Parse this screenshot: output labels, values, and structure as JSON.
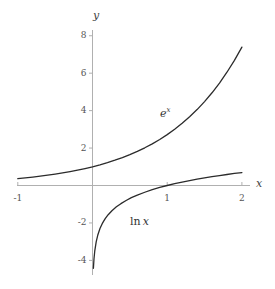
{
  "chart_data": {
    "type": "line",
    "title": "",
    "xlabel": "x",
    "ylabel": "y",
    "xlim": [
      -1.05,
      2.1
    ],
    "ylim": [
      -4.6,
      8.4
    ],
    "grid": false,
    "legend": "inline-annotations",
    "xticks": [
      -1,
      1,
      2
    ],
    "xtick_labels": [
      "-1",
      "1",
      "2"
    ],
    "yticks": [
      -4,
      -2,
      2,
      4,
      6,
      8
    ],
    "ytick_labels": [
      "-4",
      "-2",
      "2",
      "4",
      "6",
      "8"
    ],
    "annotations": [
      {
        "name": "exp-curve-label",
        "text": "e",
        "sup": "x",
        "x": 0.95,
        "y": 3.85
      },
      {
        "name": "ln-curve-label",
        "text": "ln",
        "arg": "x",
        "x": 0.52,
        "y": -1.95
      }
    ],
    "series": [
      {
        "name": "e^x",
        "label": "e^x",
        "color": "#2b2b2b",
        "x": [
          -1.0,
          -0.9,
          -0.8,
          -0.7,
          -0.6,
          -0.5,
          -0.4,
          -0.3,
          -0.2,
          -0.1,
          0.0,
          0.1,
          0.2,
          0.3,
          0.4,
          0.5,
          0.6,
          0.7,
          0.8,
          0.9,
          1.0,
          1.1,
          1.2,
          1.3,
          1.4,
          1.5,
          1.6,
          1.7,
          1.8,
          1.9,
          2.0
        ],
        "values": [
          0.368,
          0.407,
          0.449,
          0.497,
          0.549,
          0.607,
          0.67,
          0.741,
          0.819,
          0.905,
          1.0,
          1.105,
          1.221,
          1.35,
          1.492,
          1.649,
          1.822,
          2.014,
          2.226,
          2.46,
          2.718,
          3.004,
          3.32,
          3.669,
          4.055,
          4.482,
          4.953,
          5.474,
          6.05,
          6.686,
          7.389
        ]
      },
      {
        "name": "ln x",
        "label": "ln x",
        "color": "#2b2b2b",
        "x": [
          0.012,
          0.02,
          0.03,
          0.05,
          0.07,
          0.1,
          0.13,
          0.17,
          0.21,
          0.26,
          0.32,
          0.38,
          0.45,
          0.52,
          0.6,
          0.7,
          0.8,
          0.9,
          1.0,
          1.1,
          1.2,
          1.3,
          1.4,
          1.5,
          1.6,
          1.7,
          1.8,
          1.9,
          2.0
        ],
        "values": [
          -4.42,
          -3.91,
          -3.51,
          -3.0,
          -2.66,
          -2.3,
          -2.04,
          -1.77,
          -1.56,
          -1.35,
          -1.14,
          -0.97,
          -0.8,
          -0.65,
          -0.51,
          -0.36,
          -0.22,
          -0.105,
          0.0,
          0.095,
          0.182,
          0.262,
          0.336,
          0.405,
          0.47,
          0.531,
          0.588,
          0.642,
          0.693
        ]
      }
    ],
    "colors": {
      "axis": "#b0b0b0",
      "curve": "#2b2b2b",
      "tick_text": "#555555",
      "label_text": "#333333",
      "background": "#ffffff"
    }
  }
}
